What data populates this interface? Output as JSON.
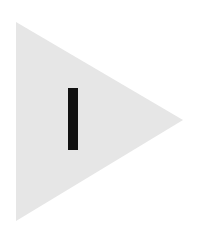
{
  "icon": {
    "name": "play-pause-icon",
    "triangle": {
      "points": "16,22 183,120 16,221",
      "fill": "#e6e6e6"
    },
    "bar": {
      "x": 68,
      "y": 88,
      "width": 10,
      "height": 62,
      "fill": "#111111"
    }
  }
}
